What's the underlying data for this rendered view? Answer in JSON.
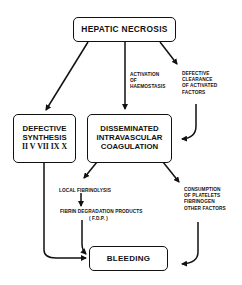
{
  "diagram": {
    "nodes": {
      "hepatic_necrosis": "HEPATIC NECROSIS",
      "defective_synthesis": [
        "DEFECTIVE",
        "SYNTHESIS",
        "II V VII IX X"
      ],
      "dic": [
        "DISSEMINATED",
        "INTRAVASCULAR",
        "COAGULATION"
      ],
      "bleeding": "BLEEDING"
    },
    "labels": {
      "activation": [
        "ACTIVATION",
        "OF",
        "HAEMOSTASIS"
      ],
      "defective_clearance": [
        "DEFECTIVE",
        "CLEARANCE",
        "OF ACTIVATED",
        "FACTORS"
      ],
      "local_fibrinolysis": "LOCAL FIBRINOLYSIS",
      "fdp": "FIBRIN DEGRADATION PRODUCTS",
      "fdp_abbrev": "( F.D.P. )",
      "consumption": [
        "CONSUMPTION",
        "OF PLATELETS",
        "FIBRINOGEN",
        "OTHER FACTORS"
      ]
    },
    "edges": [
      {
        "from": "HEPATIC NECROSIS",
        "to": "DEFECTIVE SYNTHESIS"
      },
      {
        "from": "HEPATIC NECROSIS",
        "to": "DISSEMINATED INTRAVASCULAR COAGULATION",
        "label": "ACTIVATION OF HAEMOSTASIS"
      },
      {
        "from": "HEPATIC NECROSIS",
        "to": "DISSEMINATED INTRAVASCULAR COAGULATION",
        "label": "DEFECTIVE CLEARANCE OF ACTIVATED FACTORS"
      },
      {
        "from": "DISSEMINATED INTRAVASCULAR COAGULATION",
        "to": "LOCAL FIBRINOLYSIS"
      },
      {
        "from": "LOCAL FIBRINOLYSIS",
        "to": "FIBRIN DEGRADATION PRODUCTS"
      },
      {
        "from": "FIBRIN DEGRADATION PRODUCTS",
        "to": "BLEEDING"
      },
      {
        "from": "DISSEMINATED INTRAVASCULAR COAGULATION",
        "to": "CONSUMPTION OF PLATELETS FIBRINOGEN OTHER FACTORS"
      },
      {
        "from": "CONSUMPTION OF PLATELETS FIBRINOGEN OTHER FACTORS",
        "to": "BLEEDING"
      },
      {
        "from": "DEFECTIVE SYNTHESIS",
        "to": "BLEEDING"
      }
    ]
  }
}
